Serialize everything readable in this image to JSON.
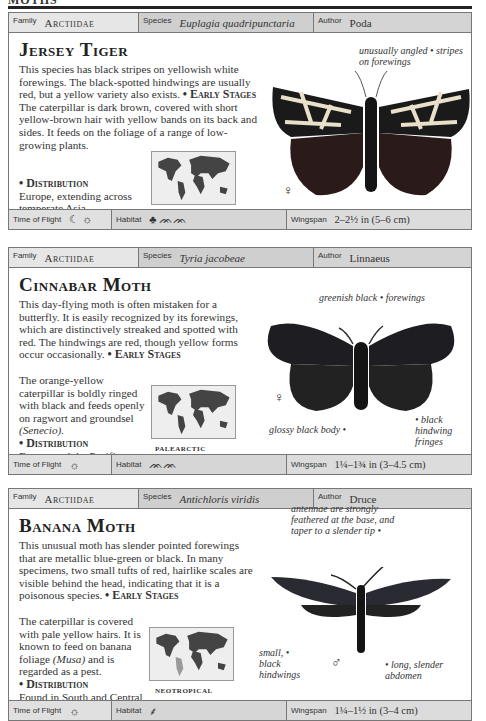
{
  "page": {
    "section_title": "MOTHS"
  },
  "labels": {
    "family": "Family",
    "species": "Species",
    "author": "Author",
    "time_of_flight": "Time of Flight",
    "habitat": "Habitat",
    "wingspan": "Wingspan"
  },
  "entries": [
    {
      "family": "Arctiidae",
      "species": "Euplagia quadripunctaria",
      "author": "Poda",
      "title": "Jersey Tiger",
      "intro": "This species has black stripes on yellowish white forewings. The black-spotted hindwings are usually red, but a yellow variety also exists.",
      "early_heading": "• Early Stages",
      "early_text": "The caterpillar is dark brown, covered with short yellow-brown hair with yellow bands on its back and sides. It feeds on the foliage of a range of low-growing plants.",
      "dist_heading": "• Distribution",
      "dist_text": "Europe, extending across temperate Asia.",
      "region": "PALEARCTIC",
      "annotations": [
        "unusually angled • stripes on forewings"
      ],
      "sex_symbol": "♀",
      "time_of_flight_icons": "☾ ☼",
      "habitat_icons": "♣ ᨏᨏ",
      "wingspan": "2–2½ in (5–6 cm)"
    },
    {
      "family": "Arctiidae",
      "species": "Tyria jacobeae",
      "author": "Linnaeus",
      "title": "Cinnabar Moth",
      "intro": "This day-flying moth is often mistaken for a butterfly. It is easily recognized by its forewings, which are distinctively streaked and spotted with red. The hindwings are red, though yellow forms occur occasionally.",
      "early_heading": "• Early Stages",
      "early_text": "The orange-yellow caterpillar is boldly ringed with black and feeds openly on ragwort and groundsel",
      "early_italic": "(Senecio).",
      "dist_heading": "• Distribution",
      "dist_text": "Europe and the Pacific coast of the USA.",
      "region": "PALEARCTIC",
      "annotations": [
        "greenish black • forewings",
        "glossy black body •",
        "• black hindwing fringes"
      ],
      "sex_symbol": "♀",
      "time_of_flight_icons": "☼",
      "habitat_icons": "ᨏᨏ",
      "wingspan": "1¼–1¾ in (3–4.5 cm)"
    },
    {
      "family": "Arctiidae",
      "species": "Antichloris viridis",
      "author": "Druce",
      "title": "Banana Moth",
      "intro": "This unusual moth has slender pointed forewings that are metallic blue-green or black. In many specimens, two small tufts of red, hairlike scales are visible behind the head, indicating that it is a poisonous species.",
      "early_heading": "• Early Stages",
      "early_text": "The caterpillar is covered with pale yellow hairs. It is known to feed on banana foliage",
      "early_italic": "(Musa)",
      "early_text2": "and is regarded as a pest.",
      "dist_heading": "• Distribution",
      "dist_text": "Found in South and Central America.",
      "region": "NEOTROPICAL",
      "annotations": [
        "antennae are strongly feathered at the base, and taper to a slender tip •",
        "small, • black hindwings",
        "• long, slender abdomen"
      ],
      "sex_symbol": "♂",
      "time_of_flight_icons": "☼",
      "habitat_icons": "⸙",
      "wingspan": "1¼–1½ in (3–4 cm)"
    }
  ]
}
